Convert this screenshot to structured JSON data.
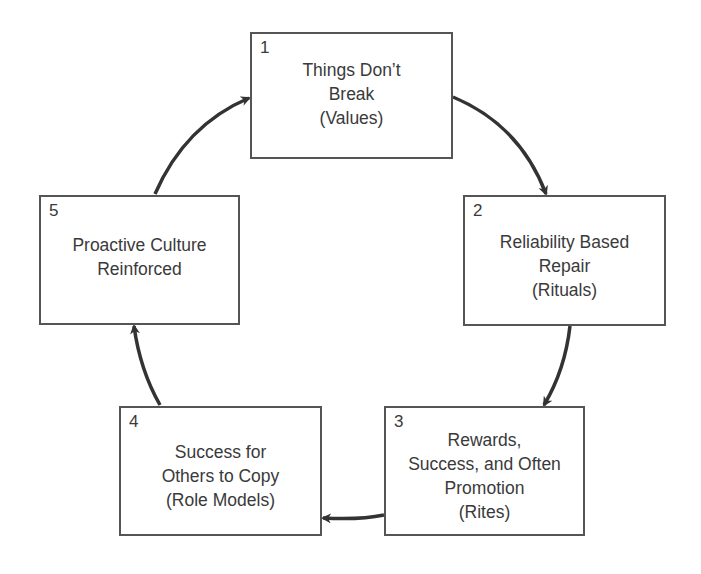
{
  "diagram": {
    "type": "cycle",
    "nodes": [
      {
        "number": "1",
        "lines": [
          "Things Don’t",
          "Break",
          "(Values)"
        ]
      },
      {
        "number": "2",
        "lines": [
          "Reliability Based",
          "Repair",
          "(Rituals)"
        ]
      },
      {
        "number": "3",
        "lines": [
          "Rewards,",
          "Success, and Often",
          "Promotion",
          "(Rites)"
        ]
      },
      {
        "number": "4",
        "lines": [
          "Success for",
          "Others to Copy",
          "(Role Models)"
        ]
      },
      {
        "number": "5",
        "lines": [
          "Proactive Culture",
          "Reinforced"
        ]
      }
    ],
    "edges": [
      {
        "from": "1",
        "to": "2"
      },
      {
        "from": "2",
        "to": "3"
      },
      {
        "from": "3",
        "to": "4"
      },
      {
        "from": "4",
        "to": "5"
      },
      {
        "from": "5",
        "to": "1"
      }
    ],
    "colors": {
      "stroke": "#555555",
      "arrow": "#333333",
      "text": "#3a3a3a"
    }
  }
}
